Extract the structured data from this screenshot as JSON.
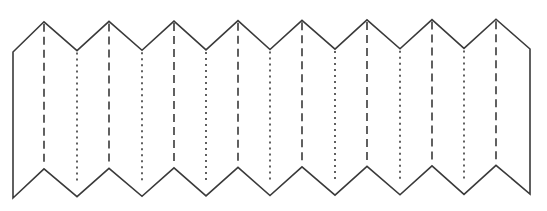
{
  "diagram": {
    "title": "",
    "colors": {
      "background": "#ffffff",
      "outline": "#3a3a3a",
      "dashed_fold": "#3a3a3a",
      "dotted_fold": "#3a3a3a"
    },
    "geometry": {
      "left_x": 13,
      "right_x": 530,
      "peak_count": 8,
      "peak_x": [
        44,
        109,
        174,
        238,
        302,
        367,
        432,
        496
      ],
      "valley_x": [
        77,
        142,
        206,
        270,
        335,
        400,
        464
      ],
      "top_corner_y_left": 52,
      "top_corner_y_right": 49,
      "top_peak_y_left": 22,
      "top_peak_y_right": 19,
      "top_valley_y_left": 51,
      "top_valley_y_right": 48,
      "bottom_corner_y_left": 198,
      "bottom_corner_y_right": 194,
      "bottom_peak_y_left": 169,
      "bottom_peak_y_right": 165,
      "bottom_valley_y_left": 197,
      "bottom_valley_y_right": 194
    },
    "fold_lines": {
      "peak_style": "dashed",
      "valley_style": "dotted",
      "dash_pattern": "8 5",
      "dot_pattern": "2 4"
    }
  }
}
